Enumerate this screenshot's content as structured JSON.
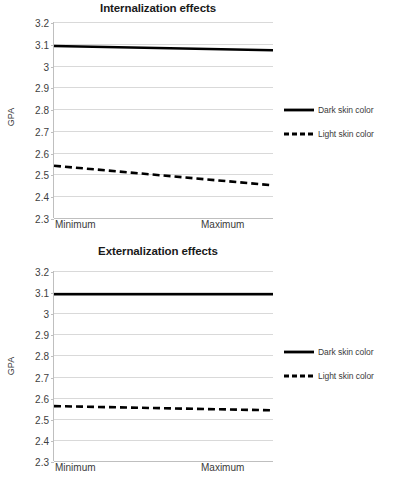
{
  "figure": {
    "background": "#ffffff",
    "width": 396,
    "height": 485
  },
  "axis": {
    "ylabel": "GPA",
    "yticks": [
      "3.2",
      "3.1",
      "3",
      "2.9",
      "2.8",
      "2.7",
      "2.6",
      "2.5",
      "2.4",
      "2.3"
    ],
    "xticks": [
      "Minimum",
      "Maximum"
    ]
  },
  "legend": {
    "entries": [
      {
        "label": "Dark skin color",
        "style": "solid",
        "color": "#000000"
      },
      {
        "label": "Light skin color",
        "style": "dashed",
        "color": "#000000"
      }
    ]
  },
  "panels": {
    "top": {
      "title": "Internalization effects"
    },
    "bottom": {
      "title": "Externalization effects"
    }
  },
  "chart_data": [
    {
      "type": "line",
      "title": "Internalization effects",
      "xlabel": "",
      "ylabel": "GPA",
      "x": [
        "Minimum",
        "Maximum"
      ],
      "ylim": [
        2.3,
        3.2
      ],
      "ytick_step": 0.1,
      "grid": true,
      "legend_position": "right",
      "series": [
        {
          "name": "Dark skin color",
          "style": "solid",
          "color": "#000000",
          "values": [
            3.09,
            3.07
          ]
        },
        {
          "name": "Light skin color",
          "style": "dashed",
          "color": "#000000",
          "values": [
            2.54,
            2.45
          ]
        }
      ]
    },
    {
      "type": "line",
      "title": "Externalization effects",
      "xlabel": "",
      "ylabel": "GPA",
      "x": [
        "Minimum",
        "Maximum"
      ],
      "ylim": [
        2.3,
        3.2
      ],
      "ytick_step": 0.1,
      "grid": true,
      "legend_position": "right",
      "series": [
        {
          "name": "Dark skin color",
          "style": "solid",
          "color": "#000000",
          "values": [
            3.09,
            3.09
          ]
        },
        {
          "name": "Light skin color",
          "style": "dashed",
          "color": "#000000",
          "values": [
            2.56,
            2.54
          ]
        }
      ]
    }
  ]
}
